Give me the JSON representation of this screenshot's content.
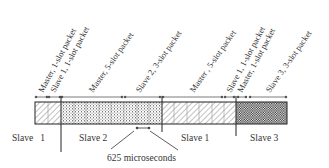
{
  "diagram": {
    "packet_labels": [
      {
        "text": "Master, 1-slot packet",
        "x": 40,
        "y": 93
      },
      {
        "text": "Slave 1, 1-slot packet",
        "x": 52,
        "y": 93
      },
      {
        "text": "Master, 5-slot packet",
        "x": 91,
        "y": 93
      },
      {
        "text": "Slave 2, 3-slot packet",
        "x": 138,
        "y": 93
      },
      {
        "text": "Master , 5-slot packet",
        "x": 193,
        "y": 93
      },
      {
        "text": "Slave 1, 1-slot packet",
        "x": 229,
        "y": 93
      },
      {
        "text": "Master, 1-slot packet",
        "x": 241,
        "y": 93
      },
      {
        "text": "Slave 3, 3-slot packet",
        "x": 268,
        "y": 93
      }
    ],
    "region_labels": [
      {
        "text": "Slave   1",
        "x": 12,
        "y": 141
      },
      {
        "text": "Slave 2",
        "x": 79,
        "y": 141
      },
      {
        "text": "Slave 1",
        "x": 181,
        "y": 141
      },
      {
        "text": "Slave 3",
        "x": 250,
        "y": 141
      }
    ],
    "slot_duration_label": "625 microseconds",
    "segments": [
      {
        "name": "slave-1-first",
        "pattern": "hatch",
        "x": 35,
        "width": 26,
        "slots": 2
      },
      {
        "name": "slave-2",
        "pattern": "dots",
        "x": 61,
        "width": 101,
        "slots": 8
      },
      {
        "name": "slave-1-second",
        "pattern": "hatch",
        "x": 162,
        "width": 74,
        "slots": 6
      },
      {
        "name": "slave-3",
        "pattern": "checker",
        "x": 236,
        "width": 51,
        "slots": 4
      }
    ],
    "colors": {
      "line": "#333333",
      "hatch": "#555555",
      "dots": "#666666",
      "checker": "#222222"
    }
  }
}
